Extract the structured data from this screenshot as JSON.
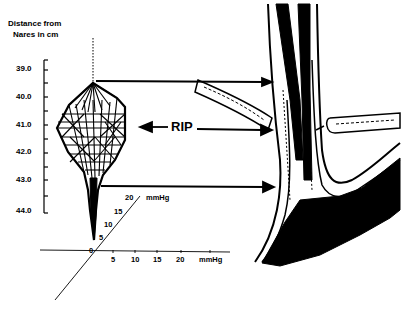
{
  "figure": {
    "y_axis": {
      "title_line1": "Distance from",
      "title_line2": "Nares in cm",
      "ticks": [
        "39.0",
        "40.0",
        "41.0",
        "42.0",
        "43.0",
        "44.0"
      ]
    },
    "pressure_axes": {
      "horizontal_ticks": [
        "0",
        "5",
        "10",
        "15",
        "20"
      ],
      "horizontal_unit": "mmHg",
      "diagonal_ticks": [
        "5",
        "10",
        "15",
        "20"
      ],
      "diagonal_unit": "mmHg"
    },
    "annotation": {
      "label": "RIP"
    },
    "colors": {
      "ink": "#000000",
      "paper": "#ffffff"
    }
  }
}
